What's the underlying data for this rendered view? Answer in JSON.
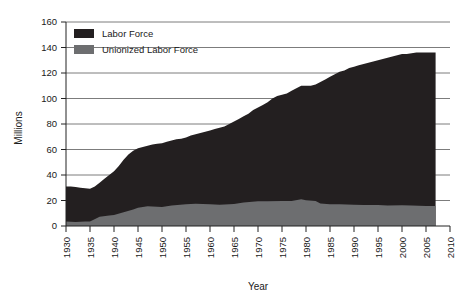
{
  "chart_data": {
    "type": "area",
    "title": "",
    "xlabel": "Year",
    "ylabel": "Millions",
    "xlim": [
      1930,
      2010
    ],
    "ylim": [
      0,
      160
    ],
    "xticks": [
      1930,
      1935,
      1940,
      1945,
      1950,
      1955,
      1960,
      1965,
      1970,
      1975,
      1980,
      1985,
      1990,
      1995,
      2000,
      2005,
      2010
    ],
    "yticks": [
      0,
      20,
      40,
      60,
      80,
      100,
      120,
      140,
      160
    ],
    "grid": "horizontal",
    "legend_position": "top-left",
    "stacked": false,
    "x": [
      1930,
      1932,
      1935,
      1937,
      1940,
      1942,
      1945,
      1947,
      1950,
      1952,
      1955,
      1957,
      1960,
      1962,
      1965,
      1967,
      1970,
      1972,
      1975,
      1977,
      1979,
      1980,
      1982,
      1985,
      1987,
      1990,
      1992,
      1995,
      1997,
      2000,
      2002,
      2005,
      2007
    ],
    "series": [
      {
        "name": "Labor Force",
        "color": "#231f20",
        "values": [
          31,
          30,
          29,
          33,
          38,
          45,
          53,
          56,
          60,
          62,
          65,
          67,
          70,
          72,
          75,
          79,
          84,
          88,
          94,
          99,
          105,
          107,
          110,
          115,
          120,
          125,
          127,
          131,
          134,
          141,
          143,
          149,
          153
        ]
      },
      {
        "name": "Unionized Labor Force",
        "color": "#6d6e70",
        "values": [
          3.5,
          3.2,
          3.6,
          7.2,
          8.7,
          10.8,
          14.3,
          15.4,
          15.0,
          16.0,
          17.0,
          17.4,
          17.0,
          16.6,
          17.3,
          18.4,
          19.4,
          19.4,
          19.6,
          19.7,
          21.0,
          20.1,
          19.6,
          17.0,
          17.0,
          16.7,
          16.4,
          16.4,
          16.1,
          16.3,
          16.1,
          15.7,
          15.7
        ]
      }
    ],
    "series_display": [
      {
        "name": "Labor Force",
        "comment": "upper boundary of dark region as drawn",
        "points": [
          [
            1930,
            31
          ],
          [
            1931,
            31
          ],
          [
            1932,
            30.5
          ],
          [
            1933,
            30
          ],
          [
            1934,
            29.6
          ],
          [
            1935,
            29.2
          ],
          [
            1936,
            31
          ],
          [
            1937,
            34
          ],
          [
            1938,
            37
          ],
          [
            1939,
            40
          ],
          [
            1940,
            43
          ],
          [
            1941,
            47
          ],
          [
            1942,
            52
          ],
          [
            1943,
            56
          ],
          [
            1944,
            59
          ],
          [
            1945,
            61
          ],
          [
            1946,
            62
          ],
          [
            1947,
            63
          ],
          [
            1948,
            64
          ],
          [
            1949,
            64.5
          ],
          [
            1950,
            65
          ],
          [
            1951,
            66
          ],
          [
            1952,
            67
          ],
          [
            1953,
            68
          ],
          [
            1954,
            68.5
          ],
          [
            1955,
            69.5
          ],
          [
            1956,
            71
          ],
          [
            1957,
            72
          ],
          [
            1958,
            73
          ],
          [
            1959,
            74
          ],
          [
            1960,
            75
          ],
          [
            1961,
            76
          ],
          [
            1962,
            77
          ],
          [
            1963,
            78
          ],
          [
            1964,
            80
          ],
          [
            1965,
            82
          ],
          [
            1966,
            84
          ],
          [
            1967,
            86
          ],
          [
            1968,
            88
          ],
          [
            1969,
            91
          ],
          [
            1970,
            93
          ],
          [
            1971,
            95
          ],
          [
            1972,
            97
          ],
          [
            1973,
            100
          ],
          [
            1974,
            102
          ],
          [
            1975,
            103
          ],
          [
            1976,
            104
          ],
          [
            1977,
            106
          ],
          [
            1978,
            108
          ],
          [
            1979,
            110
          ],
          [
            1980,
            110
          ],
          [
            1981,
            110
          ],
          [
            1982,
            111
          ],
          [
            1983,
            113
          ],
          [
            1984,
            115
          ],
          [
            1985,
            117
          ],
          [
            1986,
            119
          ],
          [
            1987,
            121
          ],
          [
            1988,
            122
          ],
          [
            1989,
            124
          ],
          [
            1990,
            125
          ],
          [
            1991,
            126
          ],
          [
            1992,
            127
          ],
          [
            1993,
            128
          ],
          [
            1994,
            129
          ],
          [
            1995,
            130
          ],
          [
            1996,
            131
          ],
          [
            1997,
            132
          ],
          [
            1998,
            133
          ],
          [
            1999,
            134
          ],
          [
            2000,
            135
          ],
          [
            2001,
            135
          ],
          [
            2002,
            135.5
          ],
          [
            2003,
            136
          ],
          [
            2004,
            136
          ],
          [
            2005,
            136
          ],
          [
            2006,
            136
          ],
          [
            2007,
            136
          ]
        ]
      },
      {
        "name": "Unionized Labor Force",
        "comment": "upper boundary of gray region as drawn",
        "points": [
          [
            1930,
            3.5
          ],
          [
            1932,
            3.2
          ],
          [
            1934,
            3.5
          ],
          [
            1935,
            3.6
          ],
          [
            1937,
            7.2
          ],
          [
            1939,
            8.2
          ],
          [
            1940,
            8.7
          ],
          [
            1942,
            10.8
          ],
          [
            1944,
            13.0
          ],
          [
            1945,
            14.3
          ],
          [
            1947,
            15.4
          ],
          [
            1950,
            15.0
          ],
          [
            1952,
            16.0
          ],
          [
            1955,
            17.0
          ],
          [
            1957,
            17.4
          ],
          [
            1960,
            17.0
          ],
          [
            1962,
            16.6
          ],
          [
            1965,
            17.3
          ],
          [
            1967,
            18.4
          ],
          [
            1970,
            19.4
          ],
          [
            1972,
            19.4
          ],
          [
            1975,
            19.6
          ],
          [
            1977,
            19.7
          ],
          [
            1979,
            21.0
          ],
          [
            1980,
            20.1
          ],
          [
            1982,
            19.6
          ],
          [
            1983,
            17.7
          ],
          [
            1985,
            17.0
          ],
          [
            1987,
            17.0
          ],
          [
            1990,
            16.7
          ],
          [
            1992,
            16.4
          ],
          [
            1995,
            16.4
          ],
          [
            1997,
            16.1
          ],
          [
            2000,
            16.3
          ],
          [
            2002,
            16.1
          ],
          [
            2005,
            15.7
          ],
          [
            2007,
            15.7
          ]
        ]
      }
    ]
  },
  "axes": {
    "y_title": "Millions",
    "x_title": "Year",
    "y_tick_labels": [
      "0",
      "20",
      "40",
      "60",
      "80",
      "100",
      "120",
      "140",
      "160"
    ],
    "x_tick_labels": [
      "1930",
      "1935",
      "1940",
      "1945",
      "1950",
      "1955",
      "1960",
      "1965",
      "1970",
      "1975",
      "1980",
      "1985",
      "1990",
      "1995",
      "2000",
      "2005",
      "2010"
    ]
  },
  "legend": {
    "items": [
      {
        "label": "Labor Force",
        "color": "#231f20"
      },
      {
        "label": "Unionized Labor Force",
        "color": "#6d6e70"
      }
    ]
  },
  "colors": {
    "labor_force": "#231f20",
    "unionized": "#6d6e70",
    "axis": "#222222",
    "gridline": "#5a5a5a",
    "background": "#ffffff"
  }
}
